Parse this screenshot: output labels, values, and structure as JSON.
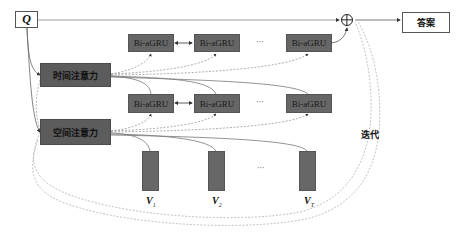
{
  "diagram": {
    "input": {
      "label": "Q"
    },
    "output": {
      "label": "答案"
    },
    "combine_symbol": "⊕",
    "attention": [
      {
        "label": "时间注意力"
      },
      {
        "label": "空间注意力"
      }
    ],
    "gru_rows": [
      {
        "cells": [
          "Bi-aGRU",
          "Bi-aGRU",
          "Bi-aGRU"
        ],
        "ellipsis": "···"
      },
      {
        "cells": [
          "Bi-aGRU",
          "Bi-aGRU",
          "Bi-aGRU"
        ],
        "ellipsis": "···"
      }
    ],
    "frames": [
      {
        "label": "V",
        "subscript": "1"
      },
      {
        "label": "V",
        "subscript": "2"
      },
      {
        "label": "V",
        "subscript": "T"
      }
    ],
    "frames_ellipsis": "···",
    "iteration_label": "迭代"
  }
}
